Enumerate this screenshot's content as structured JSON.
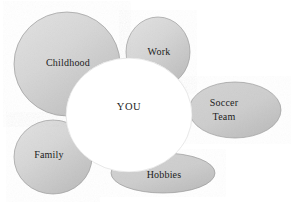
{
  "diagram": {
    "type": "cluster-web",
    "title": "",
    "center": {
      "label": "YOU",
      "fill_color": "#ffffff",
      "text_color": "#1c1c1c",
      "cx": 129,
      "cy": 115,
      "rx": 63,
      "ry": 57
    },
    "petal_fill_light": "#dcdcdc",
    "petal_fill_dark": "#b4b4b4",
    "petal_stroke": "#9a9a9a",
    "petals": [
      {
        "id": "childhood",
        "label": "Childhood",
        "label_lines": [
          "Childhood"
        ],
        "label_x": 68,
        "label_y": 64,
        "cx": 67,
        "cy": 64,
        "rx": 53,
        "ry": 52
      },
      {
        "id": "work",
        "label": "Work",
        "label_lines": [
          "Work"
        ],
        "label_x": 159,
        "label_y": 53,
        "cx": 158,
        "cy": 52,
        "rx": 32,
        "ry": 35
      },
      {
        "id": "soccer-team",
        "label": "Soccer Team",
        "label_lines": [
          "Soccer",
          "Team"
        ],
        "label_x": 224,
        "label_y": 110,
        "cx": 235,
        "cy": 110,
        "rx": 46,
        "ry": 28
      },
      {
        "id": "hobbies",
        "label": "Hobbies",
        "label_lines": [
          "Hobbies"
        ],
        "label_x": 164,
        "label_y": 176,
        "cx": 163,
        "cy": 173,
        "rx": 52,
        "ry": 20
      },
      {
        "id": "family",
        "label": "Family",
        "label_lines": [
          "Family"
        ],
        "label_x": 49,
        "label_y": 156,
        "cx": 53,
        "cy": 157,
        "rx": 39,
        "ry": 37
      }
    ]
  }
}
